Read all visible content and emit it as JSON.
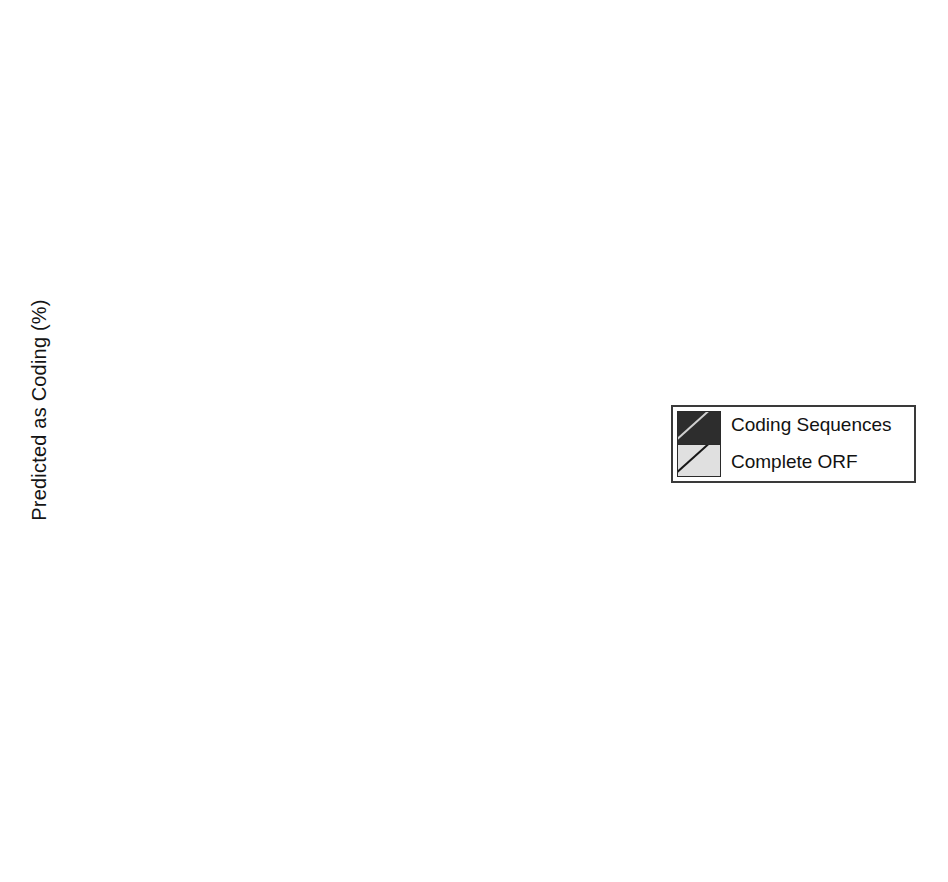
{
  "chart_data": {
    "type": "bar",
    "title": "",
    "xlabel": "",
    "ylabel": "Predicted as Coding (%)",
    "grid": false,
    "legend_position": "middle-right",
    "categories": [
      "Sure",
      "Putative",
      "Unknown",
      "Random"
    ],
    "legend": [
      "Coding Sequences",
      "Complete ORF"
    ],
    "panels": [
      {
        "label": "Olive",
        "ylim": [
          0,
          100
        ],
        "yticks": [
          0,
          10,
          20,
          30,
          40,
          50,
          60,
          70,
          80,
          90,
          100
        ],
        "ytick_labels": [
          "",
          "10",
          "20",
          "30",
          "40",
          "50",
          "60",
          "70",
          "80",
          "90",
          "100"
        ],
        "series": [
          {
            "name": "Coding Sequences",
            "values": [
              100,
              70,
              44,
              0
            ]
          },
          {
            "name": "Complete ORF",
            "values": [
              75,
              33,
              9.5,
              0
            ]
          }
        ]
      },
      {
        "label": "Pine",
        "ylim": [
          0,
          100
        ],
        "yticks": [
          0,
          10,
          20,
          30,
          40,
          50,
          60,
          70,
          80,
          90,
          100
        ],
        "ytick_labels": [
          "",
          "10",
          "20",
          "30",
          "40",
          "50",
          "60",
          "70",
          "80",
          "90",
          ""
        ],
        "series": [
          {
            "name": "Coding Sequences",
            "values": [
              100,
              72,
              23,
              0
            ]
          },
          {
            "name": "Complete ORF",
            "values": [
              88,
              49.5,
              4,
              0
            ]
          }
        ]
      },
      {
        "label": "Sole",
        "ylim": [
          0,
          100
        ],
        "yticks": [
          0,
          10,
          20,
          30,
          40,
          50,
          60,
          70,
          80,
          90,
          100
        ],
        "ytick_labels": [
          "0",
          "10",
          "20",
          "30",
          "40",
          "50",
          "60",
          "70",
          "80",
          "90",
          ""
        ],
        "series": [
          {
            "name": "Coding Sequences",
            "values": [
              95,
              77.5,
              3,
              0
            ]
          },
          {
            "name": "Complete ORF",
            "values": [
              79.5,
              62.5,
              1.5,
              0
            ]
          }
        ]
      }
    ]
  },
  "colors": {
    "coding_sequences": "#2d2d2d",
    "complete_orf": "#e0e0e0",
    "axis": "#1c1c1c",
    "background": "#ffffff"
  }
}
